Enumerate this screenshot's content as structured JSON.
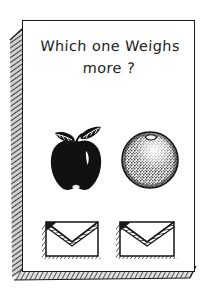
{
  "card": {
    "title_line1": "Which one Weighs",
    "title_line2": "more ?",
    "ink_color": "#1a1a1a",
    "paper_color": "#ffffff",
    "shadow_color": "#6b6b6b",
    "background_color": "#ffffff"
  },
  "items": [
    {
      "name": "apple",
      "icon": "apple-icon",
      "fill": "#111111",
      "description": "solid black apple with two leaves"
    },
    {
      "name": "orange",
      "icon": "orange-icon",
      "fill": "#f2f2f2",
      "description": "cross-hatched stippled orange sphere"
    },
    {
      "name": "envelope-left",
      "icon": "envelope-icon",
      "fill": "#ffffff",
      "description": "envelope with shaded flap"
    },
    {
      "name": "envelope-right",
      "icon": "envelope-icon",
      "fill": "#ffffff",
      "description": "envelope with shaded flap"
    }
  ]
}
